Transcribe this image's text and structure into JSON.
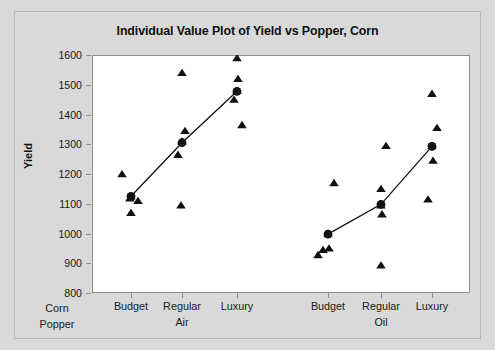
{
  "chart": {
    "title": "Individual Value Plot of Yield vs Popper, Corn",
    "ylabel": "Yield",
    "outer_label_line1": "Corn",
    "outer_label_line2": "Popper"
  },
  "chart_data": {
    "type": "scatter",
    "title": "Individual Value Plot of Yield vs Popper, Corn",
    "subtitle": "",
    "xlabel": "",
    "ylabel": "Yield",
    "ylim": [
      800,
      1600
    ],
    "yticks": [
      800,
      900,
      1000,
      1100,
      1200,
      1300,
      1400,
      1500,
      1600
    ],
    "ytick_labels": [
      "800",
      "900",
      "1000",
      "1100",
      "1200",
      "1300",
      "1400",
      "1500",
      "1600"
    ],
    "grid": false,
    "legend": false,
    "legend_position": "none",
    "outer_factor_name": "Corn",
    "inner_factor_name": "Popper",
    "outer_groups": [
      "Air",
      "Oil"
    ],
    "inner_categories": [
      "Budget",
      "Regular",
      "Luxury"
    ],
    "categories": [
      "Budget",
      "Regular",
      "Luxury",
      "Budget",
      "Regular",
      "Luxury"
    ],
    "group_labels": [
      "Air",
      "Oil"
    ],
    "marker_individual": "triangle",
    "marker_mean": "circle",
    "mean_connect_line": true,
    "series": [
      {
        "name": "Air",
        "groups": [
          {
            "category": "Budget",
            "values": [
              1200,
              1125,
              1118,
              1110,
              1070
            ],
            "mean": 1125
          },
          {
            "category": "Regular",
            "values": [
              1540,
              1345,
              1310,
              1265,
              1095
            ],
            "mean": 1305
          },
          {
            "category": "Luxury",
            "values": [
              1590,
              1520,
              1480,
              1450,
              1365
            ],
            "mean": 1478
          }
        ],
        "means": [
          1125,
          1305,
          1478
        ]
      },
      {
        "name": "Oil",
        "groups": [
          {
            "category": "Budget",
            "values": [
              1170,
              1000,
              950,
              945,
              928
            ],
            "mean": 998
          },
          {
            "category": "Regular",
            "values": [
              1295,
              1150,
              1095,
              1065,
              893
            ],
            "mean": 1098
          },
          {
            "category": "Luxury",
            "values": [
              1470,
              1355,
              1295,
              1245,
              1115
            ],
            "mean": 1293
          }
        ],
        "means": [
          998,
          1098,
          1293
        ]
      }
    ],
    "colors": {
      "marker": "#111111",
      "mean_marker": "#111111",
      "line": "#111111",
      "plot_background": "#ffffff",
      "figure_background": "#d9d9d9",
      "axis": "#8e8e8e",
      "text": "#1a1a1a"
    }
  }
}
